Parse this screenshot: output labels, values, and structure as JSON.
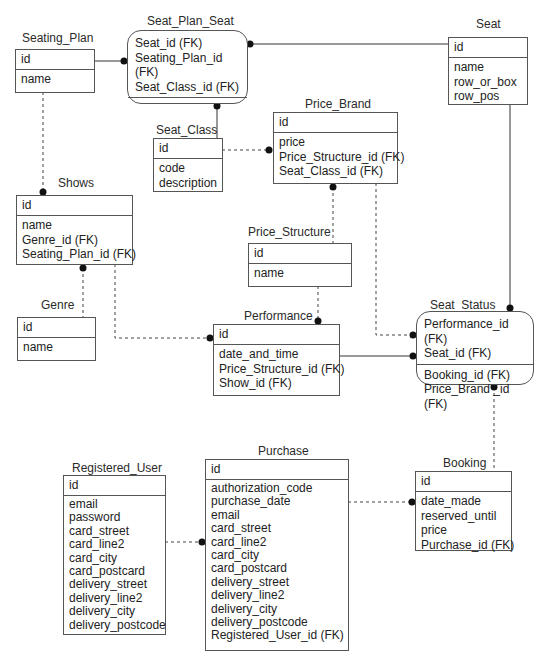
{
  "diagram": {
    "type": "entity-relationship",
    "entities": {
      "seating_plan": {
        "name": "Seating_Plan",
        "pk": "id",
        "attributes": [
          "name"
        ]
      },
      "seat_plan_seat": {
        "name": "Seat_Plan_Seat",
        "pk": "",
        "top_attributes": [
          "Seat_id (FK)",
          "Seating_Plan_id (FK)",
          "Seat_Class_id (FK)"
        ],
        "attributes": []
      },
      "seat": {
        "name": "Seat",
        "pk": "id",
        "attributes": [
          "name",
          "row_or_box",
          "row_pos"
        ]
      },
      "seat_class": {
        "name": "Seat_Class",
        "pk": "id",
        "attributes": [
          "code",
          "description"
        ]
      },
      "price_brand": {
        "name": "Price_Brand",
        "pk": "id",
        "attributes": [
          "price",
          "Price_Structure_id (FK)",
          "Seat_Class_id (FK)"
        ]
      },
      "shows": {
        "name": "Shows",
        "pk": "id",
        "attributes": [
          "name",
          "Genre_id (FK)",
          "Seating_Plan_id (FK)"
        ]
      },
      "price_structure": {
        "name": "Price_Structure",
        "pk": "id",
        "attributes": [
          "name"
        ]
      },
      "genre": {
        "name": "Genre",
        "pk": "id",
        "attributes": [
          "name"
        ]
      },
      "performance": {
        "name": "Performance",
        "pk": "id",
        "attributes": [
          "date_and_time",
          "Price_Structure_id (FK)",
          "Show_id (FK)"
        ]
      },
      "seat_status": {
        "name": "Seat_Status",
        "top_attributes": [
          "Performance_id (FK)",
          "Seat_id (FK)"
        ],
        "attributes": [
          "Booking_id (FK)",
          "Price_Brand _id (FK)"
        ]
      },
      "booking": {
        "name": "Booking",
        "pk": "id",
        "attributes": [
          "date_made",
          "reserved_until",
          "price",
          "Purchase_id (FK)"
        ]
      },
      "purchase": {
        "name": "Purchase",
        "pk": "id",
        "attributes": [
          "authorization_code",
          "purchase_date",
          "email",
          "card_street",
          "card_line2",
          "card_city",
          "card_postcard",
          "delivery_street",
          "delivery_line2",
          "delivery_city",
          "delivery_postcode",
          "Registered_User_id (FK)"
        ]
      },
      "registered_user": {
        "name": "Registered_User",
        "pk": "id",
        "attributes": [
          "email",
          "password",
          "card_street",
          "card_line2",
          "card_city",
          "card_postcard",
          "delivery_street",
          "delivery_line2",
          "delivery_city",
          "delivery_postcode"
        ]
      }
    },
    "relationships": [
      {
        "from": "Seating_Plan",
        "to": "Seat_Plan_Seat",
        "style": "solid"
      },
      {
        "from": "Seat",
        "to": "Seat_Plan_Seat",
        "style": "solid"
      },
      {
        "from": "Seat_Class",
        "to": "Seat_Plan_Seat",
        "style": "solid"
      },
      {
        "from": "Seat_Class",
        "to": "Price_Brand",
        "style": "dashed"
      },
      {
        "from": "Seating_Plan",
        "to": "Shows",
        "style": "dashed"
      },
      {
        "from": "Genre",
        "to": "Shows",
        "style": "dashed"
      },
      {
        "from": "Shows",
        "to": "Performance",
        "style": "dashed"
      },
      {
        "from": "Price_Structure",
        "to": "Price_Brand",
        "style": "dashed"
      },
      {
        "from": "Price_Structure",
        "to": "Performance",
        "style": "dashed"
      },
      {
        "from": "Price_Brand",
        "to": "Seat_Status",
        "style": "dashed"
      },
      {
        "from": "Seat",
        "to": "Seat_Status",
        "style": "solid"
      },
      {
        "from": "Performance",
        "to": "Seat_Status",
        "style": "solid"
      },
      {
        "from": "Booking",
        "to": "Seat_Status",
        "style": "dashed"
      },
      {
        "from": "Purchase",
        "to": "Booking",
        "style": "dashed"
      },
      {
        "from": "Registered_User",
        "to": "Purchase",
        "style": "dashed"
      }
    ]
  },
  "colors": {
    "line": "#333333",
    "border": "#555555",
    "background": "#ffffff"
  }
}
